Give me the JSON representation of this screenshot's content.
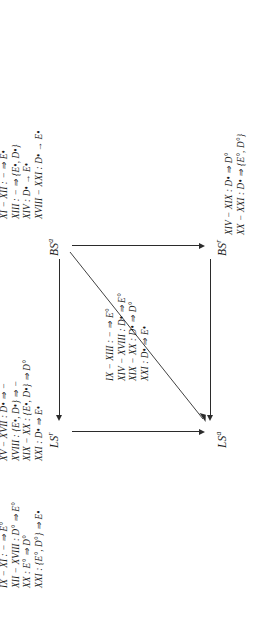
{
  "figure": {
    "nodes": [
      {
        "id": "ls-r",
        "label": "LS",
        "sup": "r"
      },
      {
        "id": "ls-a",
        "label": "LS",
        "sup": "a"
      },
      {
        "id": "bs-a",
        "label": "BS",
        "sup": "a"
      },
      {
        "id": "bs-r",
        "label": "BS",
        "sup": "r"
      }
    ],
    "edges": [
      {
        "id": "bsa-to-lsr",
        "from": "BS^a",
        "to": "LS^r",
        "direction": "left"
      },
      {
        "id": "bsr-to-lsa",
        "from": "BS^r",
        "to": "LS^a",
        "direction": "left"
      },
      {
        "id": "lsr-to-lsa",
        "from": "LS^r",
        "to": "LS^a",
        "direction": "down"
      },
      {
        "id": "bsa-to-bsr",
        "from": "BS^a",
        "to": "BS^r",
        "direction": "down"
      },
      {
        "id": "bsa-to-lsa",
        "from": "BS^a",
        "to": "LS^a",
        "direction": "diagonal"
      }
    ],
    "blocks": {
      "top_left": {
        "name": "ls-r-annotations",
        "lines": [
          {
            "rom": "XV − XVII",
            "sep": ":",
            "body": "D• ⇒ −"
          },
          {
            "rom": "XVIII",
            "sep": ":",
            "body": "{E•, D•} ⇒ −"
          },
          {
            "rom": "XIX − XX",
            "sep": ":",
            "body": "{E•, D•} ⇒ D°"
          },
          {
            "rom": "XXI",
            "sep": ":",
            "body": "D• ⇒ E•"
          }
        ],
        "lines_text": [
          "XV − XVII : D• ⇒ −",
          "XVIII : {E•, D•} ⇒ −",
          "XIX − XX : {E•, D•} ⇒ D°",
          "XXI : D• ⇒ E•"
        ]
      },
      "top_right": {
        "name": "bs-a-annotations",
        "lines_text": [
          "XI − XII : − ⇒ E•",
          "XIII : − ⇒ {E•, D•}",
          "XIV : D• → E•",
          "XVIII − XXI : D• → E•"
        ]
      },
      "middle": {
        "name": "diagonal-annotations",
        "lines_text": [
          "IX − XIII : − ⇒ E°",
          "XIV − XVIII : D• ⇒ E°",
          "XIX − XX : D• ⇒ D°",
          "XXI : D• ⇒ E•"
        ]
      },
      "bottom_right": {
        "name": "bs-r-annotations",
        "lines_text": [
          "XIV − XIX : D• ⇒ D°",
          "XX − XXI : D• ⇒ {E°, D°}"
        ]
      },
      "bottom_left": {
        "name": "ls-a-annotations",
        "lines_text": [
          "IX − XI : − ⇒ E°",
          "XII − XVIII : D° ⇒ E°",
          "XX : E° ⇒ D°",
          "XXI : {E°, D°} ⇒ E•"
        ]
      }
    },
    "colors": {
      "ink": "#1a1a1a",
      "arrow": "#2b2b2b",
      "background": "#ffffff"
    }
  }
}
